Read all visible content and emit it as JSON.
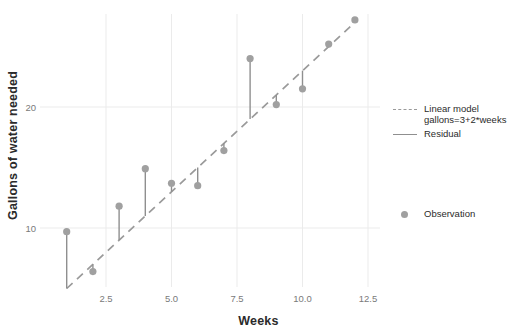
{
  "chart_data": {
    "type": "scatter",
    "title": "",
    "xlabel": "Weeks",
    "ylabel": "Gallons of water needed",
    "xlim": [
      0.35,
      12.95
    ],
    "ylim": [
      4.2,
      28.6
    ],
    "xticks": [
      "2.5",
      "5.0",
      "7.5",
      "10.0",
      "12.5"
    ],
    "xtick_values": [
      2.5,
      5.0,
      7.5,
      10.0,
      12.5
    ],
    "yticks": [
      "10",
      "20"
    ],
    "ytick_values": [
      10,
      20
    ],
    "grid": true,
    "legend_position": "right",
    "series": [
      {
        "name": "Observation",
        "type": "scatter",
        "x": [
          1,
          2,
          3,
          4,
          5,
          6,
          7,
          8,
          9,
          10,
          11,
          12
        ],
        "y": [
          9.7,
          6.4,
          11.8,
          14.9,
          13.7,
          13.5,
          16.4,
          24.0,
          20.2,
          21.5,
          25.2,
          27.2
        ],
        "color": "#a0a0a0"
      },
      {
        "name": "Linear model gallons=3+2*weeks",
        "type": "line",
        "style": "dashed",
        "intercept": 3,
        "slope": 2,
        "x": [
          1,
          12
        ],
        "y": [
          5,
          27
        ],
        "color": "#9a9a9a"
      },
      {
        "name": "Residual",
        "type": "segments",
        "style": "solid",
        "color": "#8f8f8f",
        "x": [
          1,
          2,
          3,
          4,
          5,
          6,
          7,
          8,
          9,
          10,
          11,
          12
        ],
        "y_observed": [
          9.7,
          6.4,
          11.8,
          14.9,
          13.7,
          13.5,
          16.4,
          24.0,
          20.2,
          21.5,
          25.2,
          27.2
        ],
        "y_fitted": [
          5,
          7,
          9,
          11,
          13,
          15,
          17,
          19,
          21,
          23,
          25,
          27
        ],
        "residuals": [
          4.7,
          -0.6,
          2.8,
          3.9,
          0.7,
          -1.5,
          -0.6,
          5.0,
          -0.8,
          -1.5,
          0.2,
          0.2
        ]
      }
    ]
  },
  "legend": {
    "entries": [
      {
        "label": "Linear model\ngallons=3+2*weeks",
        "key": "dashed-line-key"
      },
      {
        "label": "Residual",
        "key": "solid-line-key"
      },
      {
        "label": "Observation",
        "key": "point-key"
      }
    ]
  },
  "colors": {
    "point": "#a0a0a0",
    "model_line": "#9a9a9a",
    "residual_line": "#8f8f8f",
    "grid": "#ebebeb",
    "axis_text": "#7a7a7a",
    "title_text": "#2b2b2b",
    "background": "#ffffff"
  }
}
